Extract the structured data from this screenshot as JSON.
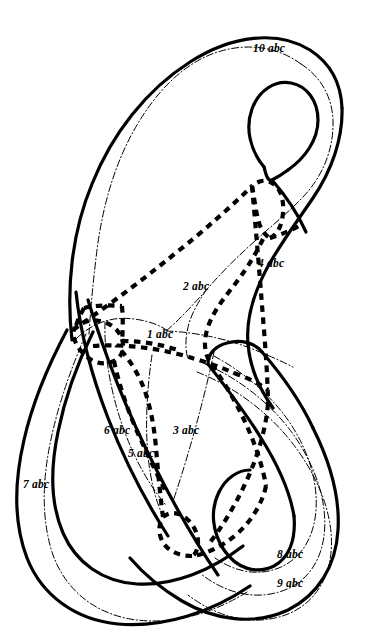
{
  "figure": {
    "background_color": "#ffffff",
    "ink_color": "#000000",
    "width": 390,
    "height": 630
  },
  "styles": {
    "solid_stroke_label": "thick solid curve",
    "dashdot_stroke_label": "thin dash-dot curve",
    "dashed_stroke_label": "thick dashed curve"
  },
  "labels": [
    {
      "id": "label-10",
      "text": "10 abc",
      "x": 253,
      "y": 43
    },
    {
      "id": "label-4",
      "text": "4 abc",
      "x": 258,
      "y": 258
    },
    {
      "id": "label-2",
      "text": "2 abc",
      "x": 183,
      "y": 281
    },
    {
      "id": "label-1",
      "text": "1 abc",
      "x": 147,
      "y": 329
    },
    {
      "id": "label-6",
      "text": "6 abc",
      "x": 104,
      "y": 425
    },
    {
      "id": "label-3",
      "text": "3 abc",
      "x": 173,
      "y": 425
    },
    {
      "id": "label-5",
      "text": "5 abc",
      "x": 128,
      "y": 448
    },
    {
      "id": "label-7",
      "text": "7 abc",
      "x": 23,
      "y": 479
    },
    {
      "id": "label-8",
      "text": "8 abc",
      "x": 277,
      "y": 549
    },
    {
      "id": "label-9",
      "text": "9 abc",
      "x": 277,
      "y": 578
    }
  ]
}
